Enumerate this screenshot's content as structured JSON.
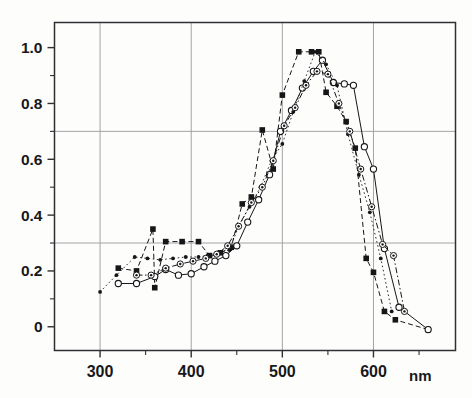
{
  "figure": {
    "title": "",
    "x_unit_label": "nm",
    "background_color": "#fdfdfc",
    "frame_color": "#303034",
    "grid_color": "#9a9a9e",
    "ink_color": "#161618"
  },
  "axes": {
    "x": {
      "label": "nm",
      "tick_labels": [
        "300",
        "400",
        "500",
        "600"
      ],
      "tick_values": [
        300,
        400,
        500,
        600
      ],
      "minor_tick_values": [
        250,
        350,
        450,
        550,
        650
      ],
      "range": [
        250,
        690
      ],
      "gridlines_at": [
        300,
        400,
        500,
        600
      ]
    },
    "y": {
      "label": "",
      "tick_labels": [
        "0",
        "0.2",
        "0.4",
        "0.6",
        "0.8",
        "1.0"
      ],
      "tick_values": [
        0,
        0.2,
        0.4,
        0.6,
        0.8,
        1.0
      ],
      "minor_tick_values": [
        0.1,
        0.3,
        0.5,
        0.7,
        0.9
      ],
      "range": [
        -0.085,
        1.09
      ],
      "gridlines_at": [
        0.3,
        0.7
      ]
    }
  },
  "chart_data": {
    "type": "line",
    "title": "",
    "xlabel": "nm",
    "ylabel": "",
    "xlim": [
      250,
      690
    ],
    "ylim": [
      -0.085,
      1.09
    ],
    "grid": true,
    "gridlines_x": [
      300,
      400,
      500,
      600
    ],
    "gridlines_y": [
      0.3,
      0.7
    ],
    "legend": "none",
    "series": [
      {
        "name": "filled-square-series",
        "marker": "filled-square",
        "linestyle": "dashed",
        "x": [
          320,
          340,
          358,
          360,
          372,
          390,
          408,
          420,
          432,
          444,
          456,
          466,
          478,
          490,
          500,
          518,
          532,
          540,
          548,
          560,
          570,
          580,
          592,
          600,
          612,
          624,
          660
        ],
        "y": [
          0.21,
          0.2,
          0.35,
          0.14,
          0.305,
          0.305,
          0.305,
          0.255,
          0.265,
          0.285,
          0.44,
          0.465,
          0.705,
          0.565,
          0.83,
          0.985,
          0.985,
          0.985,
          0.84,
          0.79,
          0.735,
          0.64,
          0.245,
          0.195,
          0.055,
          0.025,
          -0.01
        ]
      },
      {
        "name": "open-circle-series",
        "marker": "open-circle",
        "linestyle": "solid",
        "x": [
          320,
          340,
          360,
          372,
          386,
          400,
          414,
          426,
          438,
          450,
          462,
          474,
          486,
          498,
          510,
          522,
          534,
          544,
          556,
          568,
          578,
          590,
          600,
          612,
          628,
          660
        ],
        "y": [
          0.155,
          0.155,
          0.18,
          0.205,
          0.185,
          0.19,
          0.215,
          0.235,
          0.255,
          0.29,
          0.375,
          0.455,
          0.545,
          0.7,
          0.775,
          0.855,
          0.915,
          0.955,
          0.875,
          0.87,
          0.865,
          0.645,
          0.565,
          0.28,
          0.07,
          -0.01
        ]
      },
      {
        "name": "small-dot-series",
        "marker": "small-filled-dot",
        "linestyle": "dotted",
        "x": [
          300,
          318,
          338,
          352,
          366,
          380,
          394,
          408,
          418,
          430,
          442,
          452,
          464,
          476,
          488,
          500,
          512,
          524,
          536,
          548,
          560,
          572,
          584,
          596,
          608,
          620
        ],
        "y": [
          0.125,
          0.185,
          0.25,
          0.245,
          0.24,
          0.245,
          0.25,
          0.25,
          0.255,
          0.265,
          0.275,
          0.36,
          0.43,
          0.5,
          0.595,
          0.655,
          0.77,
          0.88,
          0.985,
          0.94,
          0.865,
          0.69,
          0.545,
          0.41,
          0.245,
          0.055
        ]
      },
      {
        "name": "dotted-circle-series",
        "marker": "circle-with-center-dot",
        "linestyle": "dash-dot",
        "x": [
          340,
          356,
          372,
          388,
          402,
          416,
          428,
          440,
          452,
          466,
          478,
          490,
          502,
          514,
          526,
          538,
          550,
          562,
          574,
          586,
          598,
          610,
          622,
          634
        ],
        "y": [
          0.185,
          0.185,
          0.21,
          0.225,
          0.235,
          0.245,
          0.26,
          0.29,
          0.36,
          0.445,
          0.5,
          0.595,
          0.72,
          0.785,
          0.865,
          0.915,
          0.905,
          0.8,
          0.7,
          0.565,
          0.43,
          0.295,
          0.255,
          0.055
        ]
      }
    ]
  }
}
